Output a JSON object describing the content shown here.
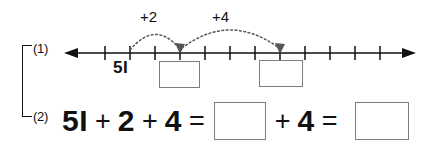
{
  "worksheet": {
    "rows": [
      {
        "label": "(1)"
      },
      {
        "label": "(2)"
      }
    ]
  },
  "numberline": {
    "start_value": "5I",
    "arcs": [
      {
        "label": "+2",
        "from_tick": 1,
        "to_tick": 3
      },
      {
        "label": "+4",
        "from_tick": 3,
        "to_tick": 7
      }
    ],
    "tick_count": 12,
    "tick_spacing_px": 25,
    "left_arrow": "arrow-left-icon",
    "right_arrow": "arrow-right-icon",
    "blanks": [
      {
        "value": ""
      },
      {
        "value": ""
      }
    ]
  },
  "equation": {
    "tokens": [
      {
        "kind": "number",
        "text": "5I"
      },
      {
        "kind": "operator",
        "text": "+"
      },
      {
        "kind": "number",
        "text": "2"
      },
      {
        "kind": "operator",
        "text": "+"
      },
      {
        "kind": "number",
        "text": "4"
      },
      {
        "kind": "operator",
        "text": "="
      },
      {
        "kind": "blank",
        "text": ""
      },
      {
        "kind": "operator",
        "text": "+"
      },
      {
        "kind": "number",
        "text": "4"
      },
      {
        "kind": "operator",
        "text": "="
      },
      {
        "kind": "blank",
        "text": ""
      }
    ]
  },
  "colors": {
    "ink": "#111111",
    "blank_border": "#7d7d7d",
    "arc_dots": "#6b6b6b",
    "paper": "#ffffff"
  }
}
